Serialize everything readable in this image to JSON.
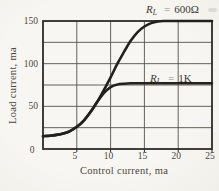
{
  "figure": {
    "background": "#f6f4ef",
    "curve_color": "#23211d",
    "grid_color": "#55514a",
    "border_color": "#2e2c27",
    "text_color": "#4a463f"
  },
  "chart_data": {
    "type": "line",
    "title": "",
    "xlabel": "Control current, ma",
    "ylabel": "Load current, ma",
    "xlim": [
      0,
      25
    ],
    "ylim": [
      0,
      150
    ],
    "x_grid_step": 5,
    "y_grid_step": 25,
    "grid": "on",
    "legend_position": "inline-annotations",
    "x_ticks": [
      5,
      10,
      15,
      20,
      25
    ],
    "y_ticks": [
      50,
      100,
      150
    ],
    "origin_label": "0",
    "x": [
      0,
      1,
      2,
      3,
      4,
      5,
      6,
      7,
      8,
      9,
      10,
      11,
      12,
      13,
      14,
      15,
      16,
      17,
      18,
      20,
      22,
      25
    ],
    "series": [
      {
        "name": "RL = 600 ohm",
        "values": [
          15,
          15.5,
          16.5,
          18,
          21,
          26,
          33,
          43,
          55,
          69,
          84,
          100,
          114,
          127,
          137,
          143.5,
          147.5,
          149.5,
          150,
          150,
          150,
          150
        ]
      },
      {
        "name": "RL = 1K",
        "values": [
          15,
          15.5,
          16.5,
          18,
          21,
          26,
          33,
          43,
          55,
          65.5,
          72.5,
          75.5,
          76.5,
          77,
          77,
          77,
          77,
          77,
          77,
          77,
          77,
          77
        ]
      }
    ],
    "annotations": {
      "label_600": {
        "r": "R",
        "sub": "L",
        "eq": "=",
        "val": "600Ω"
      },
      "label_1k": {
        "r": "R",
        "sub": "L",
        "eq": "=",
        "val": "1K"
      }
    }
  }
}
